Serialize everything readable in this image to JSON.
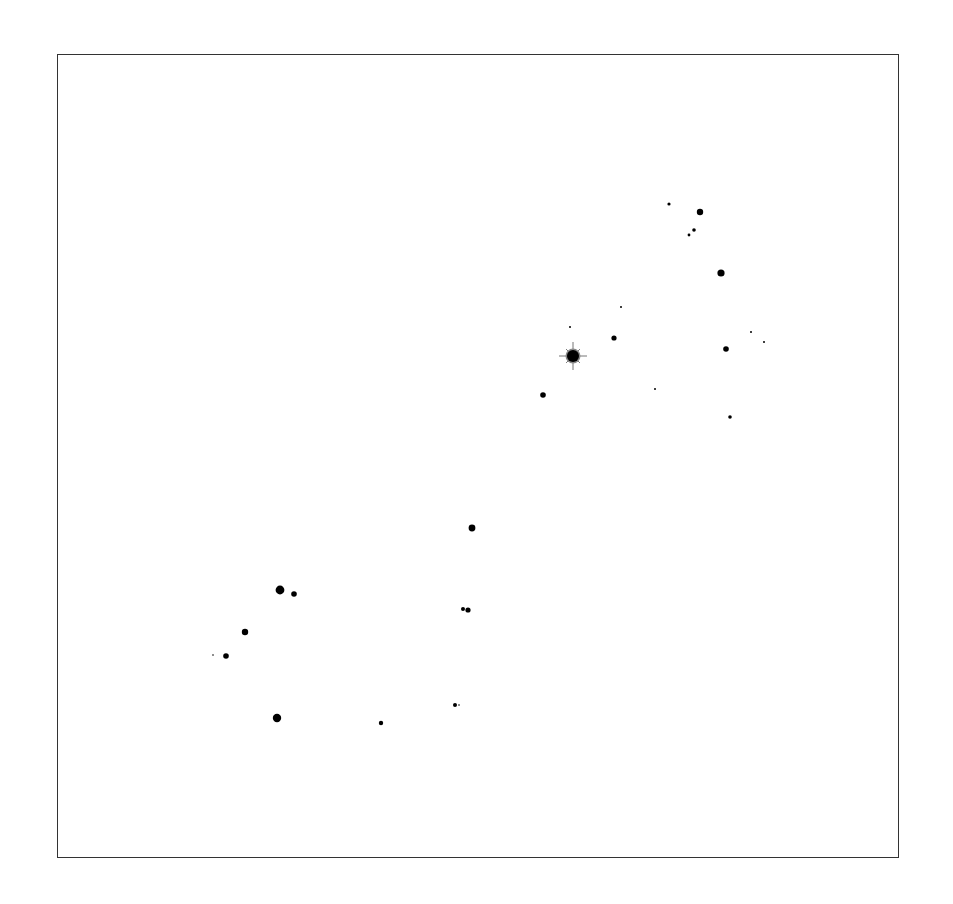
{
  "chart": {
    "frame": {
      "x": 57,
      "y": 54,
      "width": 842,
      "height": 804,
      "stroke": "#333333"
    },
    "star_color": "#000000",
    "bright_star": {
      "x": 573,
      "y": 356,
      "r": 6,
      "ray_length": 14,
      "rays": 8,
      "ray_color": "#777777"
    },
    "stars": [
      {
        "x": 669,
        "y": 204,
        "r": 1.6
      },
      {
        "x": 700,
        "y": 212,
        "r": 3.2
      },
      {
        "x": 694,
        "y": 230,
        "r": 1.8
      },
      {
        "x": 689,
        "y": 235,
        "r": 1.4
      },
      {
        "x": 721,
        "y": 273,
        "r": 3.6
      },
      {
        "x": 621,
        "y": 307,
        "r": 1.0
      },
      {
        "x": 570,
        "y": 327,
        "r": 1.0
      },
      {
        "x": 614,
        "y": 338,
        "r": 2.6
      },
      {
        "x": 751,
        "y": 332,
        "r": 1.0
      },
      {
        "x": 764,
        "y": 342,
        "r": 1.0
      },
      {
        "x": 726,
        "y": 349,
        "r": 2.8
      },
      {
        "x": 655,
        "y": 389,
        "r": 1.0
      },
      {
        "x": 543,
        "y": 395,
        "r": 2.8
      },
      {
        "x": 730,
        "y": 417,
        "r": 1.8
      },
      {
        "x": 472,
        "y": 528,
        "r": 3.4
      },
      {
        "x": 280,
        "y": 590,
        "r": 4.4
      },
      {
        "x": 294,
        "y": 594,
        "r": 2.8
      },
      {
        "x": 463,
        "y": 609,
        "r": 2.0
      },
      {
        "x": 468,
        "y": 610,
        "r": 2.6
      },
      {
        "x": 245,
        "y": 632,
        "r": 3.2
      },
      {
        "x": 213,
        "y": 655,
        "r": 0.8
      },
      {
        "x": 226,
        "y": 656,
        "r": 2.8
      },
      {
        "x": 455,
        "y": 705,
        "r": 2.0
      },
      {
        "x": 459,
        "y": 705,
        "r": 0.8
      },
      {
        "x": 277,
        "y": 718,
        "r": 4.2
      },
      {
        "x": 381,
        "y": 723,
        "r": 2.2
      }
    ]
  }
}
